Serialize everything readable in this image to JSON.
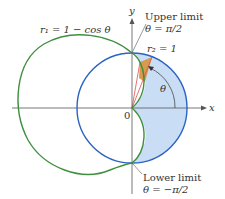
{
  "diagram": {
    "curves": [
      {
        "name": "cardioid",
        "label": "r₁ = 1 − cos θ",
        "color": "#3f8f3f"
      },
      {
        "name": "unit-circle",
        "label": "r₂ = 1",
        "color": "#2a63c4"
      }
    ],
    "axes": {
      "x_label": "x",
      "y_label": "y",
      "origin_label": "0"
    },
    "annotations": {
      "upper_limit_title": "Upper limit",
      "upper_limit_value": "θ = π/2",
      "lower_limit_title": "Lower limit",
      "lower_limit_value": "θ = −π/2",
      "angle_label": "θ"
    },
    "colors": {
      "shaded_region": "#c9def4",
      "wedge": "#d79a4e",
      "rays": "#d9534f",
      "axis": "#555555"
    }
  }
}
